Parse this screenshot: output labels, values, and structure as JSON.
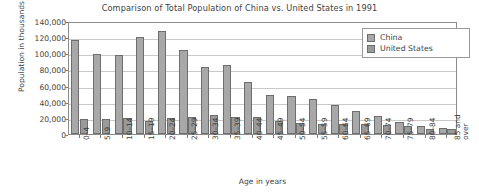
{
  "chart_data": {
    "type": "bar",
    "title": "Comparison of Total Population of China vs. United States in 1991",
    "xlabel": "Age in years",
    "ylabel": "Population in thousands",
    "ylim": [
      0,
      140000
    ],
    "ytick_step": 20000,
    "ytick_labels": [
      "140,000",
      "120,000",
      "100,000",
      "80,000",
      "60,000",
      "40,000",
      "20,000",
      "0"
    ],
    "ytick_values": [
      140000,
      120000,
      100000,
      80000,
      60000,
      40000,
      20000,
      0
    ],
    "grid": true,
    "legend_position": "top-right",
    "categories": [
      "0–4",
      "5–9",
      "10–14",
      "15–19",
      "20–24",
      "25–29",
      "30–34",
      "35–39",
      "40–44",
      "45–49",
      "50–54",
      "55–59",
      "60–64",
      "65–69",
      "70–74",
      "75–79",
      "80–84",
      "85 and\nover"
    ],
    "series": [
      {
        "name": "China",
        "color": "#a8a8a8",
        "values": [
          116000,
          99000,
          97500,
          120500,
          127500,
          104500,
          83500,
          85000,
          64500,
          48500,
          46500,
          43500,
          36000,
          29000,
          22000,
          14500,
          9500,
          7500
        ]
      },
      {
        "name": "United States",
        "color": "#9a9a9a",
        "values": [
          19000,
          18000,
          19500,
          16500,
          19500,
          21500,
          23000,
          20500,
          20500,
          16500,
          14000,
          12000,
          13000,
          12500,
          11500,
          10000,
          6500,
          6500
        ]
      }
    ]
  },
  "legend": {
    "items": [
      {
        "label": "China"
      },
      {
        "label": "United States"
      }
    ]
  }
}
